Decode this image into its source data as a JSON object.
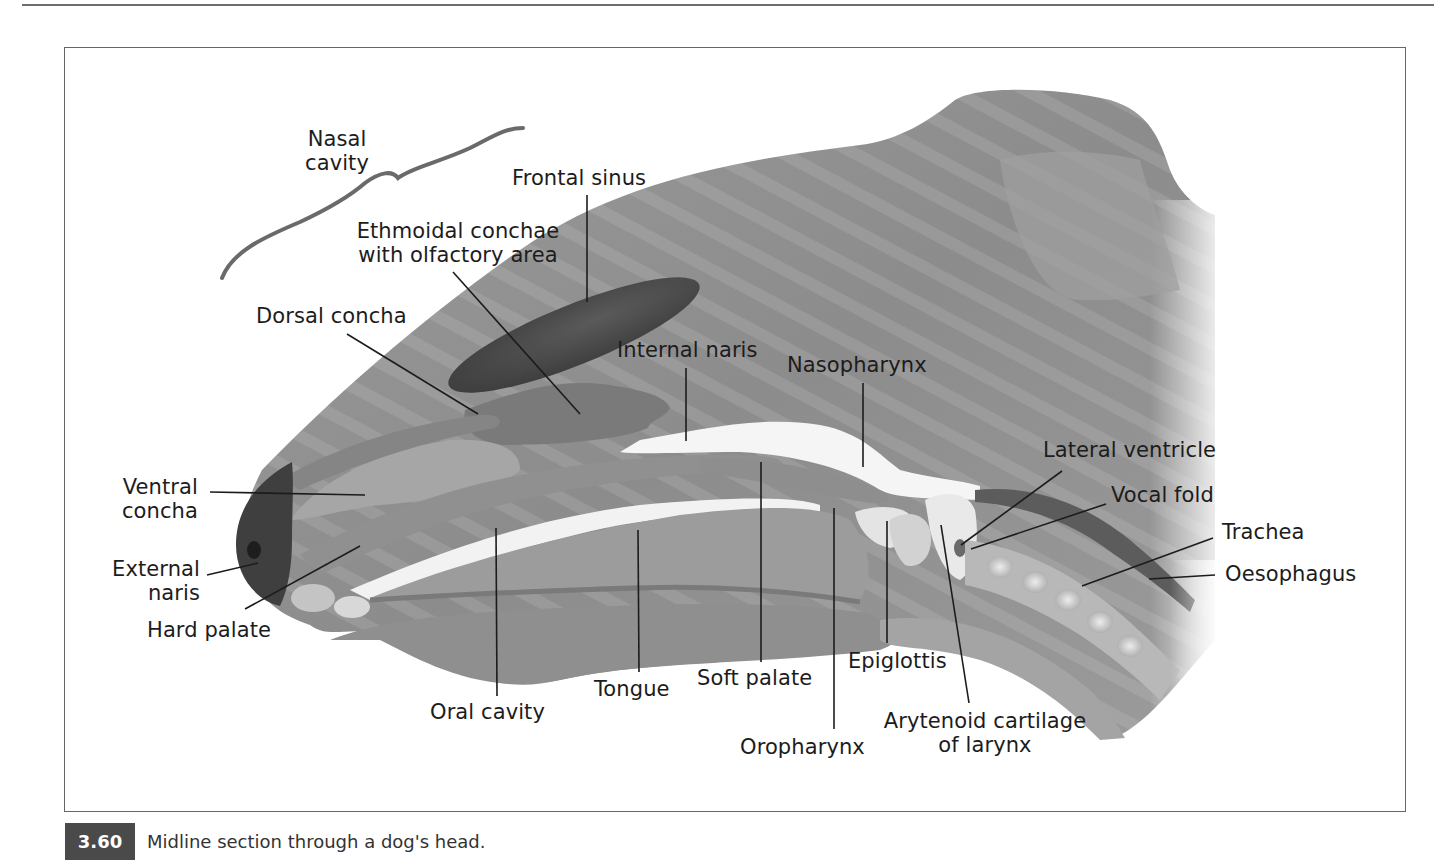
{
  "figure": {
    "number": "3.60",
    "caption": "Midline section through a dog's head.",
    "colors": {
      "frame": "#666666",
      "caption_badge": "#4a4a4a",
      "head_fill": "#8a8a8a",
      "dark_structure": "#4e4e4e",
      "airway": "#f4f4f4",
      "leader_line": "#1c1c1c"
    }
  },
  "labels": [
    {
      "id": "nasal-cavity",
      "text": "Nasal\ncavity",
      "x": 292,
      "y": 127,
      "align": "center",
      "w": 90
    },
    {
      "id": "frontal-sinus",
      "text": "Frontal sinus",
      "x": 512,
      "y": 166,
      "align": "left"
    },
    {
      "id": "ethmoidal-conchae",
      "text": "Ethmoidal conchae\nwith olfactory area",
      "x": 340,
      "y": 219,
      "align": "center",
      "w": 236
    },
    {
      "id": "dorsal-concha",
      "text": "Dorsal concha",
      "x": 256,
      "y": 304,
      "align": "left"
    },
    {
      "id": "internal-naris",
      "text": "Internal naris",
      "x": 617,
      "y": 338,
      "align": "left"
    },
    {
      "id": "nasopharynx",
      "text": "Nasopharynx",
      "x": 787,
      "y": 353,
      "align": "left"
    },
    {
      "id": "lateral-ventricle",
      "text": "Lateral ventricle",
      "x": 1043,
      "y": 438,
      "align": "left"
    },
    {
      "id": "vocal-fold",
      "text": "Vocal fold",
      "x": 1111,
      "y": 483,
      "align": "left"
    },
    {
      "id": "trachea",
      "text": "Trachea",
      "x": 1222,
      "y": 520,
      "align": "left"
    },
    {
      "id": "oesophagus",
      "text": "Oesophagus",
      "x": 1225,
      "y": 562,
      "align": "left"
    },
    {
      "id": "ventral-concha",
      "text": "Ventral\nconcha",
      "x": 108,
      "y": 475,
      "align": "right",
      "w": 90
    },
    {
      "id": "external-naris",
      "text": "External\nnaris",
      "x": 100,
      "y": 557,
      "align": "right",
      "w": 100
    },
    {
      "id": "hard-palate",
      "text": "Hard palate",
      "x": 147,
      "y": 618,
      "align": "left"
    },
    {
      "id": "oral-cavity",
      "text": "Oral cavity",
      "x": 430,
      "y": 700,
      "align": "left"
    },
    {
      "id": "tongue",
      "text": "Tongue",
      "x": 594,
      "y": 677,
      "align": "left"
    },
    {
      "id": "soft-palate",
      "text": "Soft palate",
      "x": 697,
      "y": 666,
      "align": "left"
    },
    {
      "id": "epiglottis",
      "text": "Epiglottis",
      "x": 848,
      "y": 649,
      "align": "left"
    },
    {
      "id": "oropharynx",
      "text": "Oropharynx",
      "x": 740,
      "y": 735,
      "align": "left"
    },
    {
      "id": "arytenoid-cartilage",
      "text": "Arytenoid cartilage\nof larynx",
      "x": 873,
      "y": 709,
      "align": "center",
      "w": 224
    }
  ],
  "leader_lines": [
    {
      "id": "frontal-sinus-line",
      "x1": 587,
      "y1": 195,
      "x2": 587,
      "y2": 302
    },
    {
      "id": "ethmoidal-line",
      "x1": 453,
      "y1": 272,
      "x2": 580,
      "y2": 414
    },
    {
      "id": "dorsal-concha-line",
      "x1": 347,
      "y1": 334,
      "x2": 478,
      "y2": 414
    },
    {
      "id": "internal-naris-line",
      "x1": 686,
      "y1": 368,
      "x2": 686,
      "y2": 441
    },
    {
      "id": "nasopharynx-line",
      "x1": 863,
      "y1": 383,
      "x2": 863,
      "y2": 467
    },
    {
      "id": "lateral-ventricle-line",
      "x1": 1062,
      "y1": 471,
      "x2": 961,
      "y2": 545
    },
    {
      "id": "vocal-fold-line",
      "x1": 1106,
      "y1": 504,
      "x2": 971,
      "y2": 549
    },
    {
      "id": "trachea-line",
      "x1": 1213,
      "y1": 538,
      "x2": 1082,
      "y2": 586
    },
    {
      "id": "oesophagus-line",
      "x1": 1215,
      "y1": 575,
      "x2": 1149,
      "y2": 579
    },
    {
      "id": "ventral-concha-line",
      "x1": 210,
      "y1": 492,
      "x2": 365,
      "y2": 495
    },
    {
      "id": "external-naris-line",
      "x1": 207,
      "y1": 575,
      "x2": 258,
      "y2": 563
    },
    {
      "id": "hard-palate-line",
      "x1": 245,
      "y1": 609,
      "x2": 360,
      "y2": 546
    },
    {
      "id": "oral-cavity-line",
      "x1": 497,
      "y1": 696,
      "x2": 496,
      "y2": 528
    },
    {
      "id": "tongue-line",
      "x1": 639,
      "y1": 672,
      "x2": 638,
      "y2": 530
    },
    {
      "id": "soft-palate-line",
      "x1": 761,
      "y1": 662,
      "x2": 761,
      "y2": 462
    },
    {
      "id": "oropharynx-line",
      "x1": 834,
      "y1": 729,
      "x2": 834,
      "y2": 508
    },
    {
      "id": "epiglottis-line",
      "x1": 887,
      "y1": 643,
      "x2": 887,
      "y2": 521
    },
    {
      "id": "arytenoid-line",
      "x1": 969,
      "y1": 703,
      "x2": 941,
      "y2": 525
    }
  ]
}
